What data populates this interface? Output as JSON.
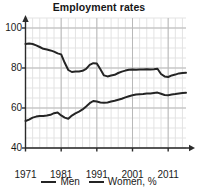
{
  "chart_data": {
    "type": "line",
    "title": "Employment rates",
    "xlabel": "",
    "ylabel": "",
    "xlim": [
      1971,
      2016
    ],
    "ylim": [
      40,
      105
    ],
    "grid": true,
    "legend_position": "bottom",
    "yticks": [
      40,
      60,
      80,
      100
    ],
    "xticks": [
      1971,
      1981,
      1991,
      2001,
      2011
    ],
    "x": [
      1971,
      1972,
      1973,
      1974,
      1975,
      1976,
      1977,
      1978,
      1979,
      1980,
      1981,
      1982,
      1983,
      1984,
      1985,
      1986,
      1987,
      1988,
      1989,
      1990,
      1991,
      1992,
      1993,
      1994,
      1995,
      1996,
      1997,
      1998,
      1999,
      2000,
      2001,
      2002,
      2003,
      2004,
      2005,
      2006,
      2007,
      2008,
      2009,
      2010,
      2011,
      2012,
      2013,
      2014,
      2015,
      2016
    ],
    "series": [
      {
        "name": "Men",
        "color": "#242424",
        "values": [
          92.0,
          92.2,
          92.0,
          91.3,
          90.5,
          89.6,
          89.2,
          88.8,
          88.2,
          87.3,
          86.8,
          82.6,
          79.0,
          78.0,
          78.2,
          78.3,
          78.6,
          79.6,
          81.6,
          82.4,
          82.3,
          79.4,
          76.3,
          75.8,
          76.2,
          76.6,
          77.5,
          78.2,
          78.7,
          79.1,
          79.2,
          79.1,
          79.2,
          79.3,
          79.4,
          79.3,
          79.4,
          79.6,
          77.0,
          75.8,
          75.5,
          76.3,
          76.7,
          77.3,
          77.5,
          77.6
        ]
      },
      {
        "name": "Women, %",
        "color": "#242424",
        "values": [
          53.5,
          54.2,
          55.2,
          55.7,
          56.0,
          56.0,
          56.2,
          56.6,
          57.4,
          57.8,
          56.3,
          55.2,
          54.6,
          56.2,
          57.3,
          58.2,
          59.3,
          60.8,
          62.4,
          63.5,
          63.2,
          62.8,
          62.6,
          62.8,
          63.2,
          63.6,
          64.1,
          64.6,
          65.3,
          65.9,
          66.4,
          66.7,
          66.9,
          67.0,
          67.2,
          67.3,
          67.5,
          67.7,
          67.1,
          66.5,
          66.4,
          66.8,
          67.0,
          67.3,
          67.5,
          67.6
        ]
      }
    ]
  },
  "legend": {
    "items": [
      {
        "label": "Men"
      },
      {
        "label": "Women, %"
      }
    ]
  }
}
